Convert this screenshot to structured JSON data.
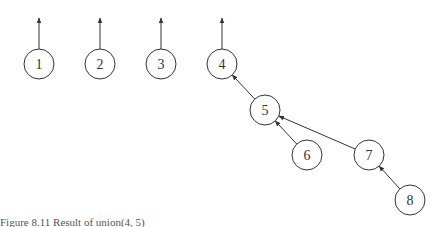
{
  "diagram": {
    "type": "union-find-forest",
    "node_radius": 15,
    "stroke_color": "#333333",
    "nodes": [
      {
        "id": "1",
        "label": "1",
        "x": 39,
        "y": 64
      },
      {
        "id": "2",
        "label": "2",
        "x": 100,
        "y": 64
      },
      {
        "id": "3",
        "label": "3",
        "x": 161,
        "y": 64
      },
      {
        "id": "4",
        "label": "4",
        "x": 222,
        "y": 64
      },
      {
        "id": "5",
        "label": "5",
        "x": 265,
        "y": 110
      },
      {
        "id": "6",
        "label": "6",
        "x": 307,
        "y": 155
      },
      {
        "id": "7",
        "label": "7",
        "x": 369,
        "y": 155
      },
      {
        "id": "8",
        "label": "8",
        "x": 410,
        "y": 200
      }
    ],
    "root_arrows": [
      "1",
      "2",
      "3",
      "4"
    ],
    "edges": [
      {
        "from": "5",
        "to": "4"
      },
      {
        "from": "6",
        "to": "5"
      },
      {
        "from": "7",
        "to": "5"
      },
      {
        "from": "8",
        "to": "7"
      }
    ]
  },
  "caption": "Figure 8.11   Result of union(4, 5)"
}
